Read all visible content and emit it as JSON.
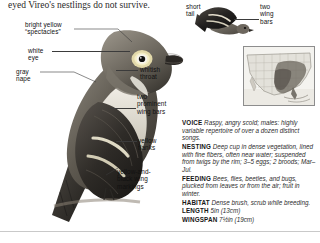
{
  "page": {
    "running_text": "eyed Vireo's nestlings do not survive."
  },
  "illustration_labels": {
    "spectacles": {
      "line1": "bright yellow",
      "line2": "“spectacles”"
    },
    "white_eye": {
      "line1": "white",
      "line2": "eye"
    },
    "gray_nape": {
      "line1": "gray",
      "line2": "nape"
    },
    "whitish_throat": {
      "line1": "whitish",
      "line2": "throat"
    },
    "wing_bars": {
      "line1": "two",
      "line2": "prominent",
      "line3": "wing bars"
    },
    "yellow_flanks": {
      "line1": "yellow",
      "line2": "flanks"
    },
    "wing_markings": {
      "line1": "yellow-and-",
      "line2": "black wing",
      "line3": "markings"
    },
    "short_tail": {
      "line1": "short",
      "line2": "tail"
    },
    "flight_wing_bars": {
      "line1": "two",
      "line2": "wing",
      "line3": "bars"
    }
  },
  "facts": [
    {
      "key": "VOICE",
      "value": "Raspy, angry scold; males: highly variable repertoire of over a dozen distinct songs."
    },
    {
      "key": "NESTING",
      "value": "Deep cup in dense vegetation, lined with fine fibers, often near water; suspended from twigs by the rim; 3–5 eggs; 2 broods; Mar–Jul."
    },
    {
      "key": "FEEDING",
      "value": "Bees, flies, beetles, and bugs, plucked from leaves or from the air; fruit in winter."
    },
    {
      "key": "HABITAT",
      "value": "Dense brush, scrub while breeding."
    },
    {
      "key": "LENGTH",
      "value": "5in (13cm)"
    },
    {
      "key": "WINGSPAN",
      "value": "7½in (19cm)"
    }
  ],
  "range_map": {
    "name": "north-america-range-map",
    "shaded_region": "southeastern United States"
  },
  "colors": {
    "rule": "#4a4a4a",
    "text": "#161616",
    "label": "#111111"
  }
}
